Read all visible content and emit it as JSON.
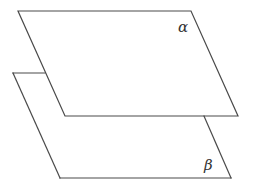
{
  "diagram": {
    "type": "parallel-planes",
    "planes": [
      {
        "name": "alpha",
        "label": "α",
        "position": "upper",
        "visibility": "fully visible"
      },
      {
        "name": "beta",
        "label": "β",
        "position": "lower",
        "visibility": "partially hidden behind alpha"
      }
    ],
    "stroke_color": "#4a4a4a",
    "background_color": "#ffffff"
  }
}
